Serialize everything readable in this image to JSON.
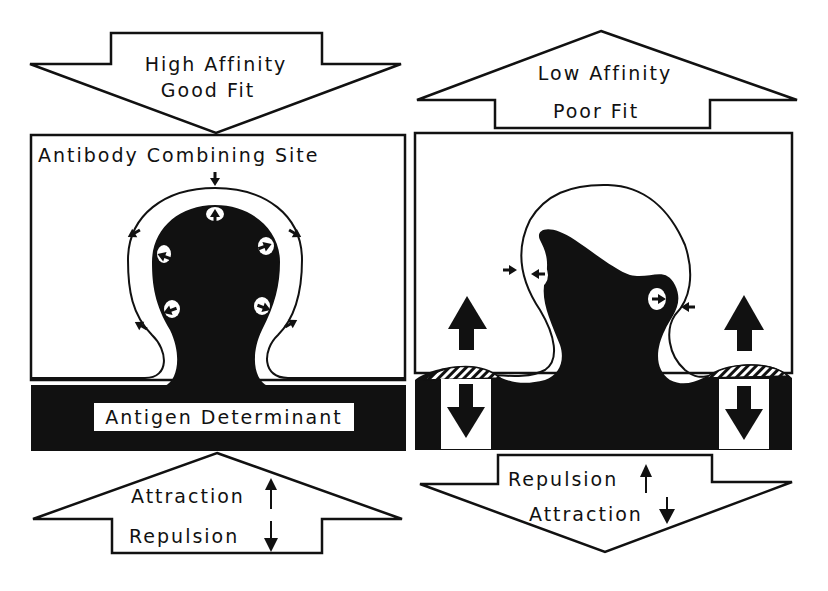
{
  "colors": {
    "ink": "#111111",
    "paper": "#ffffff"
  },
  "left_panel": {
    "top_arrow": {
      "line1": "High Affinity",
      "line2": "Good Fit",
      "direction": "down"
    },
    "box_label": "Antibody Combining Site",
    "antigen_label": "Antigen Determinant",
    "bottom_arrow": {
      "line1": "Attraction",
      "line2": "Repulsion",
      "direction": "up",
      "line1_arrow": "up",
      "line2_arrow": "down"
    }
  },
  "right_panel": {
    "top_arrow": {
      "line1": "Low Affinity",
      "line2": "Poor Fit",
      "direction": "up"
    },
    "bottom_arrow": {
      "line1": "Repulsion",
      "line2": "Attraction",
      "direction": "down",
      "line1_arrow": "up",
      "line2_arrow": "down"
    }
  }
}
